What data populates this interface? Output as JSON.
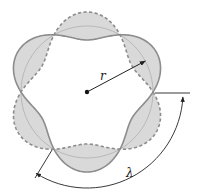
{
  "diagram": {
    "labels": {
      "radius": "r",
      "wavelength": "λ"
    },
    "geometry": {
      "center": [
        87,
        92
      ],
      "ring_radius": 66,
      "num_wavelengths": 3,
      "num_nodes": 6,
      "amplitude": 14
    },
    "colors": {
      "lobe_fill": "#d9d9d9",
      "solid_wave": "#8c8c8c",
      "dashed_wave": "#8c8c8c",
      "inner_ring": "#b0b0b0",
      "arrow": "#222222",
      "center_dot": "#111111",
      "background": "#ffffff"
    },
    "legend": {
      "solid": "wave crest (solid)",
      "dashed": "wave trough (dashed)"
    }
  }
}
